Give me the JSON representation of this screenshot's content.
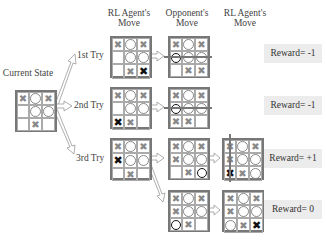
{
  "headers": {
    "current_state": "Current State",
    "col_rl": "RL Agent's Move",
    "col_opponent": "Opponent's Move",
    "col_rl2": "RL Agent's Move"
  },
  "tries": [
    {
      "label": "1st Try"
    },
    {
      "label": "2nd Try"
    },
    {
      "label": "3rd Try"
    }
  ],
  "rewards": [
    "Reward= -1",
    "Reward= -1",
    "Reward= +1",
    "Reward= 0"
  ],
  "boards": {
    "current": [
      [
        "X",
        "O",
        "X"
      ],
      [
        "",
        "O",
        "O"
      ],
      [
        "",
        "X",
        ""
      ]
    ],
    "rl_try1": [
      [
        "X",
        "O",
        "X"
      ],
      [
        "",
        "O",
        "O"
      ],
      [
        "",
        "X",
        "X*"
      ]
    ],
    "rl_try2": [
      [
        "X",
        "O",
        "X"
      ],
      [
        "",
        "O",
        "O"
      ],
      [
        "X*",
        "X",
        ""
      ]
    ],
    "rl_try3": [
      [
        "X",
        "O",
        "X"
      ],
      [
        "X*",
        "O",
        "O"
      ],
      [
        "",
        "X",
        ""
      ]
    ],
    "opp_try1": [
      [
        "X",
        "O",
        "X"
      ],
      [
        "O*",
        "O",
        "O"
      ],
      [
        "",
        "X",
        "X"
      ]
    ],
    "opp_try2": [
      [
        "X",
        "O",
        "X"
      ],
      [
        "O*",
        "O",
        "O"
      ],
      [
        "X",
        "X",
        ""
      ]
    ],
    "opp_try3a": [
      [
        "X",
        "O",
        "X"
      ],
      [
        "X",
        "O",
        "O"
      ],
      [
        "",
        "X",
        "O*"
      ]
    ],
    "opp_try3b": [
      [
        "X",
        "O",
        "X"
      ],
      [
        "X",
        "O",
        "O"
      ],
      [
        "O*",
        "X",
        ""
      ]
    ],
    "rl_final_a": [
      [
        "X",
        "O",
        "X"
      ],
      [
        "X",
        "O",
        "O"
      ],
      [
        "X*",
        "X",
        "O"
      ]
    ],
    "rl_final_b": [
      [
        "X",
        "O",
        "X"
      ],
      [
        "X",
        "O",
        "O"
      ],
      [
        "O",
        "X",
        "X*"
      ]
    ]
  },
  "colors": {
    "grid": "#777777",
    "piece": "#888888",
    "new_piece": "#111111",
    "reward_bg": "#ececec"
  }
}
